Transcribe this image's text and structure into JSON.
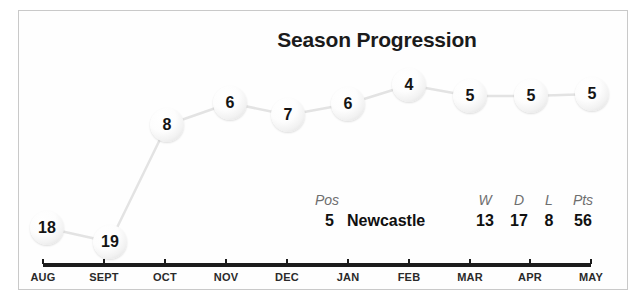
{
  "chart_data": {
    "type": "line",
    "title": "Season Progression",
    "xlabel": "",
    "ylabel": "League Position",
    "categories": [
      "AUG",
      "SEPT",
      "OCT",
      "NOV",
      "DEC",
      "JAN",
      "FEB",
      "MAR",
      "APR",
      "MAY"
    ],
    "values": [
      18,
      19,
      8,
      6,
      7,
      6,
      4,
      5,
      5,
      5
    ],
    "series": [
      {
        "name": "Newcastle league position",
        "values": [
          18,
          19,
          8,
          6,
          7,
          6,
          4,
          5,
          5,
          5
        ]
      }
    ],
    "ylim": [
      1,
      20
    ],
    "y_inverted": true,
    "grid": false,
    "legend": "none",
    "point_labels": [
      "18",
      "19",
      "8",
      "6",
      "7",
      "6",
      "4",
      "5",
      "5",
      "5"
    ],
    "line_color": "#e2e2e2",
    "marker_color": "#f4f4f4",
    "label_color": "#141414"
  },
  "chart": {
    "title": "Season Progression",
    "axis": {
      "ticks": [
        {
          "label": "AUG",
          "x": 43,
          "value": 18
        },
        {
          "label": "SEPT",
          "x": 104,
          "value": 19
        },
        {
          "label": "OCT",
          "x": 165,
          "value": 8
        },
        {
          "label": "NOV",
          "x": 226,
          "value": 6
        },
        {
          "label": "DEC",
          "x": 287,
          "value": 7
        },
        {
          "label": "JAN",
          "x": 348,
          "value": 6
        },
        {
          "label": "FEB",
          "x": 409,
          "value": 4
        },
        {
          "label": "MAR",
          "x": 470,
          "value": 5
        },
        {
          "label": "APR",
          "x": 530,
          "value": 5
        },
        {
          "label": "MAY",
          "x": 591,
          "value": 5
        }
      ]
    },
    "points": [
      {
        "label": "18",
        "x": 47,
        "y": 228
      },
      {
        "label": "19",
        "x": 110,
        "y": 242
      },
      {
        "label": "8",
        "x": 167,
        "y": 125
      },
      {
        "label": "6",
        "x": 230,
        "y": 103
      },
      {
        "label": "7",
        "x": 288,
        "y": 115
      },
      {
        "label": "6",
        "x": 348,
        "y": 104
      },
      {
        "label": "4",
        "x": 409,
        "y": 85
      },
      {
        "label": "5",
        "x": 470,
        "y": 96
      },
      {
        "label": "5",
        "x": 531,
        "y": 96
      },
      {
        "label": "5",
        "x": 592,
        "y": 94
      }
    ]
  },
  "stats": {
    "pos_header": "Pos",
    "pos_value": "5",
    "team_name": "Newcastle",
    "columns": [
      {
        "header": "W",
        "value": "13",
        "x": 170
      },
      {
        "header": "D",
        "value": "17",
        "x": 204
      },
      {
        "header": "L",
        "value": "8",
        "x": 234
      },
      {
        "header": "Pts",
        "value": "56",
        "x": 268
      }
    ]
  }
}
